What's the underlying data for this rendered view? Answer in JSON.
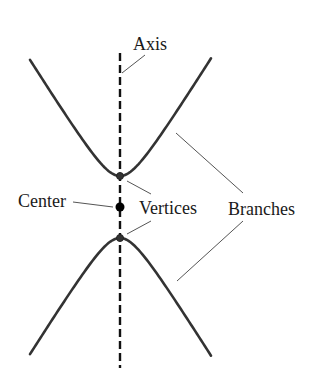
{
  "diagram": {
    "type": "hyperbola-anatomy",
    "labels": {
      "axis": "Axis",
      "center": "Center",
      "vertices": "Vertices",
      "branches": "Branches"
    },
    "geometry": {
      "center": {
        "x": 120,
        "y": 207
      },
      "a": 31,
      "b": 19.4,
      "x_range": [
        30,
        211
      ],
      "axis_line": {
        "x": 120,
        "y1": 53,
        "y2": 368
      },
      "vertices": [
        {
          "x": 120,
          "y": 176
        },
        {
          "x": 120,
          "y": 238
        }
      ]
    },
    "colors": {
      "curve": "#333333",
      "axis": "#111111",
      "leader": "#555555",
      "text": "#1a1a1a"
    }
  }
}
